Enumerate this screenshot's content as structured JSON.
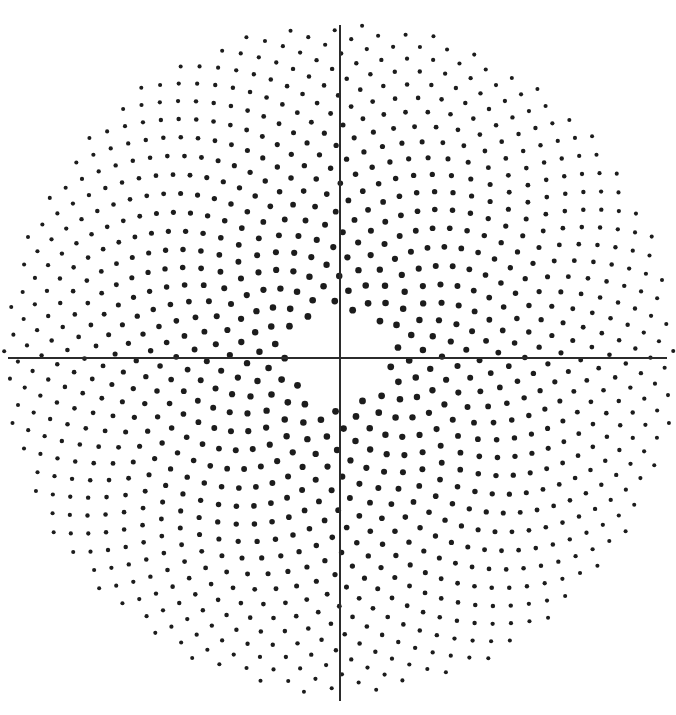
{
  "figure": {
    "kind": "phyllotaxis-scatter-plot",
    "title": "",
    "width": 676,
    "height": 715,
    "background_color": "#ffffff"
  },
  "axes": {
    "origin": {
      "x": 340,
      "y": 358
    },
    "x_axis": {
      "name": "horizontal-axis",
      "x1": 8,
      "y1": 358,
      "x2": 667,
      "y2": 358,
      "color": "#2b2b2b",
      "stroke_width": 1.6,
      "tick_labels": [],
      "label": ""
    },
    "y_axis": {
      "name": "vertical-axis",
      "x1": 340,
      "y1": 25,
      "x2": 340,
      "y2": 701,
      "color": "#2b2b2b",
      "stroke_width": 1.6,
      "tick_labels": [],
      "label": ""
    }
  },
  "chart_data": {
    "type": "scatter",
    "title": "",
    "subtitle": "",
    "xlabel": "",
    "ylabel": "",
    "xlim": [
      -340,
      336
    ],
    "ylim": [
      -343,
      357
    ],
    "grid": false,
    "legend": null,
    "legend_position": "none",
    "annotations": [],
    "generator": {
      "model": "vogel-spiral",
      "divergence_angle_deg": 137.508,
      "radius_rule": "r = c * sqrt(n)",
      "radial_scale_c": 10.1,
      "n_start": 23,
      "n_end": 1120,
      "inner_void_radius_px": 48,
      "outer_radius_px": 336,
      "phase_offset_deg": 15
    },
    "markers": {
      "shape": "circle",
      "color": "#1c1c1c",
      "radius_inner_px": 3.4,
      "radius_outer_px": 2.0,
      "size_rule": "radius shrinks linearly with distance from origin"
    },
    "point_count": 1098
  }
}
